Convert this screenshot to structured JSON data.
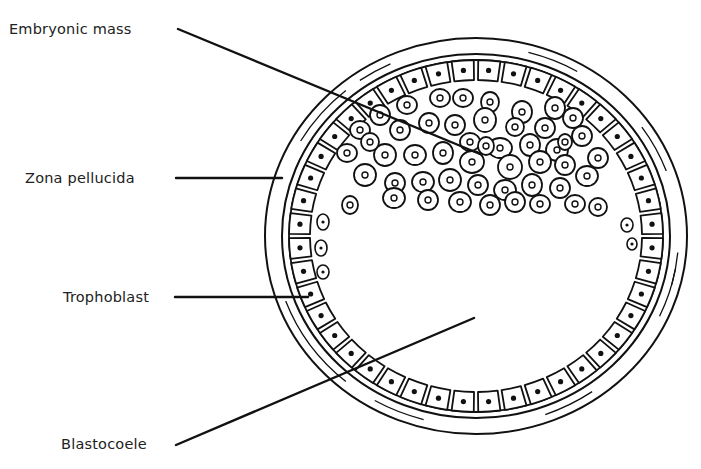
{
  "labels": {
    "embryonic_mass": "Embryonic mass",
    "zona_pellucida": "Zona pellucida",
    "trophoblast": "Trophoblast",
    "blastocoele": "Blastocoele"
  },
  "colors": {
    "ink": "#111111",
    "background": "#ffffff",
    "text": "#222222"
  },
  "geometry": {
    "center": [
      476,
      236
    ],
    "outer_zona": [
      211,
      198
    ],
    "inner_zona": [
      194,
      182
    ],
    "troph_outer": [
      187,
      176
    ],
    "troph_inner": [
      166,
      156
    ],
    "trophoblast_cell_count": 44
  },
  "leaders": [
    {
      "name": "embryonic-mass-leader",
      "from": [
        178,
        29
      ],
      "to": [
        480,
        154
      ]
    },
    {
      "name": "zona-pellucida-leader",
      "from": [
        176,
        178
      ],
      "to": [
        282,
        178
      ]
    },
    {
      "name": "trophoblast-leader",
      "from": [
        175,
        297
      ],
      "to": [
        308,
        297
      ]
    },
    {
      "name": "blastocoele-leader",
      "from": [
        176,
        445
      ],
      "to": [
        474,
        318
      ]
    }
  ],
  "embryonic_cells": [
    [
      440,
      98,
      10,
      9
    ],
    [
      463,
      98,
      10,
      9
    ],
    [
      490,
      102,
      9,
      10
    ],
    [
      522,
      112,
      10,
      11
    ],
    [
      555,
      108,
      10,
      11
    ],
    [
      407,
      105,
      10,
      9
    ],
    [
      429,
      123,
      10,
      10
    ],
    [
      455,
      125,
      10,
      10
    ],
    [
      485,
      120,
      11,
      12
    ],
    [
      515,
      127,
      9,
      9
    ],
    [
      545,
      128,
      10,
      10
    ],
    [
      573,
      118,
      10,
      10
    ],
    [
      380,
      115,
      10,
      10
    ],
    [
      400,
      130,
      10,
      10
    ],
    [
      470,
      142,
      10,
      9
    ],
    [
      500,
      148,
      12,
      10
    ],
    [
      530,
      145,
      10,
      11
    ],
    [
      557,
      150,
      11,
      11
    ],
    [
      582,
      136,
      10,
      10
    ],
    [
      598,
      158,
      10,
      10
    ],
    [
      360,
      130,
      10,
      9
    ],
    [
      385,
      155,
      11,
      11
    ],
    [
      415,
      155,
      11,
      10
    ],
    [
      443,
      153,
      10,
      11
    ],
    [
      472,
      162,
      12,
      11
    ],
    [
      510,
      167,
      12,
      12
    ],
    [
      540,
      162,
      11,
      11
    ],
    [
      565,
      165,
      10,
      10
    ],
    [
      587,
      176,
      11,
      10
    ],
    [
      347,
      153,
      10,
      9
    ],
    [
      365,
      175,
      11,
      11
    ],
    [
      395,
      183,
      10,
      10
    ],
    [
      423,
      182,
      11,
      10
    ],
    [
      450,
      180,
      11,
      11
    ],
    [
      478,
      185,
      10,
      10
    ],
    [
      505,
      190,
      11,
      10
    ],
    [
      532,
      185,
      10,
      11
    ],
    [
      560,
      188,
      10,
      10
    ],
    [
      575,
      204,
      10,
      9
    ],
    [
      350,
      205,
      8,
      9
    ],
    [
      394,
      198,
      11,
      10
    ],
    [
      428,
      200,
      10,
      10
    ],
    [
      460,
      202,
      11,
      10
    ],
    [
      490,
      205,
      10,
      10
    ],
    [
      515,
      202,
      10,
      10
    ],
    [
      540,
      204,
      10,
      9
    ],
    [
      598,
      207,
      9,
      9
    ],
    [
      370,
      142,
      9,
      9
    ],
    [
      486,
      146,
      8,
      9
    ],
    [
      565,
      142,
      7,
      8
    ]
  ],
  "cavity_cells": [
    [
      323,
      222,
      6,
      8
    ],
    [
      321,
      248,
      6,
      8
    ],
    [
      323,
      272,
      6,
      7
    ],
    [
      627,
      225,
      6,
      7
    ],
    [
      632,
      244,
      5,
      6
    ]
  ]
}
